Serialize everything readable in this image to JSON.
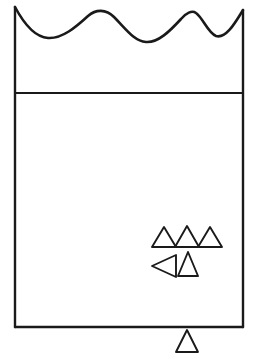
{
  "canvas": {
    "width": 258,
    "height": 359,
    "background_color": "#ffffff",
    "title": "Line drawing of a container with wavy top and triangles"
  },
  "style": {
    "stroke_color": "#1a1a1a",
    "frame_stroke_width": 2.4,
    "wave_stroke_width": 2.6,
    "rim_stroke_width": 1.9,
    "triangle_stroke_width": 1.9
  },
  "container": {
    "name": "container-body",
    "left_x": 15,
    "right_x": 243,
    "bottom_y": 327,
    "rim_y": 93,
    "left_wall_path": "M 15 7 L 15 327",
    "right_wall_path": "M 243 10 L 243 327",
    "bottom_path": "M 15 327 L 243 327",
    "rim_path": "M 15 93 L 243 93"
  },
  "wave": {
    "name": "wavy-top-edge",
    "path": "M 15 7 C 23 22 34 37 48 38 C 62 39 76 27 88 16 C 96 9 106 9 114 17 C 126 29 134 41 146 42 C 158 43 170 31 181 19 C 186 13 192 10 196 13 C 203 18 208 33 216 36 C 226 39 235 23 243 10",
    "crest_count": 3,
    "trough_count": 3,
    "points": [
      {
        "label": "start-left",
        "x": 15,
        "y": 7,
        "kind": "endpoint"
      },
      {
        "label": "trough-1",
        "x": 48,
        "y": 38,
        "kind": "trough"
      },
      {
        "label": "crest-1",
        "x": 100,
        "y": 11,
        "kind": "crest"
      },
      {
        "label": "trough-2",
        "x": 145,
        "y": 42,
        "kind": "trough"
      },
      {
        "label": "crest-2",
        "x": 193,
        "y": 11,
        "kind": "crest"
      },
      {
        "label": "trough-3",
        "x": 216,
        "y": 36,
        "kind": "trough"
      },
      {
        "label": "end-right",
        "x": 243,
        "y": 10,
        "kind": "endpoint"
      }
    ]
  },
  "triangles": [
    {
      "name": "triangle-top-row-1",
      "group": "top-row",
      "direction": "up",
      "points": "152,247 164,227 176,247"
    },
    {
      "name": "triangle-top-row-2",
      "group": "top-row",
      "direction": "up",
      "points": "175,247 187,226 199,247"
    },
    {
      "name": "triangle-top-row-3",
      "group": "top-row",
      "direction": "up",
      "points": "198,247 210,227 222,247"
    },
    {
      "name": "triangle-second-row-left-pointing",
      "group": "second-row",
      "direction": "left",
      "points": "152,266 176,255 176,277"
    },
    {
      "name": "triangle-second-row-up",
      "group": "second-row",
      "direction": "up",
      "points": "178,276 188,252 198,276"
    },
    {
      "name": "triangle-below-container",
      "group": "outside-bottom",
      "direction": "up",
      "points": "176,352 187,330 198,352"
    }
  ],
  "counts": {
    "total_triangles": 6,
    "triangles_inside": 5,
    "triangles_outside": 1,
    "up_triangles": 5,
    "left_triangles": 1
  }
}
